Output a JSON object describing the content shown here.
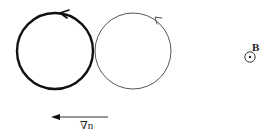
{
  "diagram": {
    "colors": {
      "stroke": "#111111",
      "thin_stroke": "#555555",
      "background": "#ffffff"
    },
    "orbits": [
      {
        "id": "left-orbit",
        "cx": 55,
        "cy": 51,
        "r": 38,
        "stroke_width": 2.4,
        "style": "thick",
        "direction": "counterclockwise",
        "arrow_at": {
          "x": 64,
          "y": 13
        }
      },
      {
        "id": "right-orbit",
        "cx": 133,
        "cy": 51,
        "r": 38,
        "stroke_width": 1,
        "style": "thin",
        "direction": "counterclockwise",
        "arrow_at": {
          "x": 158,
          "y": 20
        }
      }
    ],
    "magnetic_field": {
      "label": "B",
      "symbol": "out-of-page (dot in circle)",
      "cx": 250,
      "cy": 57,
      "r": 5
    },
    "gradient_arrow": {
      "label": "∇n",
      "x1": 108,
      "y1": 117,
      "x2": 52,
      "y2": 117,
      "direction": "left"
    }
  }
}
